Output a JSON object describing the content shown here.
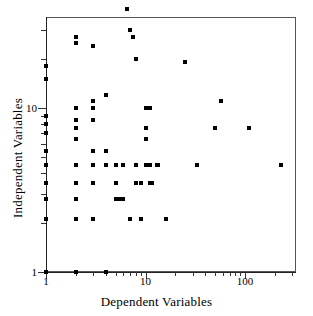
{
  "figure": {
    "background": "#ffffff",
    "frame_color": "#555555",
    "marker_color": "#000000"
  },
  "chart_data": {
    "type": "scatter",
    "title": "",
    "subtitle": "",
    "xlabel": "Dependent Variables",
    "ylabel": "Independent Variables",
    "xscale": "log",
    "yscale": "log",
    "xlim": [
      1,
      300
    ],
    "ylim": [
      1,
      45
    ],
    "grid": false,
    "legend": null,
    "xticks": [
      1,
      10,
      100
    ],
    "xticklabels": [
      "1",
      "10",
      "100"
    ],
    "yticks": [
      1,
      10
    ],
    "yticklabels": [
      "1",
      "10"
    ],
    "xminor": [
      2,
      3,
      4,
      5,
      6,
      7,
      8,
      9,
      20,
      30,
      40,
      50,
      60,
      70,
      80,
      90,
      200,
      300
    ],
    "yminor": [
      2,
      3,
      4,
      5,
      6,
      7,
      8,
      9,
      20,
      30,
      40
    ],
    "marker": "square",
    "marker_size_px": 4,
    "points": [
      [
        1,
        18
      ],
      [
        1,
        15
      ],
      [
        1,
        9
      ],
      [
        1,
        8
      ],
      [
        1,
        7
      ],
      [
        1,
        5.5
      ],
      [
        1,
        4.5
      ],
      [
        1,
        3.5
      ],
      [
        1,
        2.8
      ],
      [
        1,
        2.1
      ],
      [
        1,
        1.0
      ],
      [
        2,
        27
      ],
      [
        2,
        25
      ],
      [
        2,
        10
      ],
      [
        2,
        8.5
      ],
      [
        2,
        7.5
      ],
      [
        2,
        6.5
      ],
      [
        2,
        4.5
      ],
      [
        2,
        3.5
      ],
      [
        2,
        2.8
      ],
      [
        2,
        2.1
      ],
      [
        2,
        1.0
      ],
      [
        3,
        24
      ],
      [
        3,
        11
      ],
      [
        3,
        10
      ],
      [
        3,
        8.5
      ],
      [
        3,
        5.5
      ],
      [
        3,
        4.5
      ],
      [
        3,
        3.5
      ],
      [
        3,
        2.1
      ],
      [
        4,
        12
      ],
      [
        4,
        5.5
      ],
      [
        4,
        4.5
      ],
      [
        4,
        1.0
      ],
      [
        5,
        4.5
      ],
      [
        5,
        3.5
      ],
      [
        5,
        2.8
      ],
      [
        5.6,
        2.8
      ],
      [
        6,
        4.5
      ],
      [
        6,
        2.8
      ],
      [
        6.5,
        40
      ],
      [
        7,
        30
      ],
      [
        7,
        2.1
      ],
      [
        7.5,
        27
      ],
      [
        8,
        20
      ],
      [
        8,
        4.5
      ],
      [
        8,
        3.5
      ],
      [
        9,
        3.5
      ],
      [
        9,
        2.1
      ],
      [
        10,
        10
      ],
      [
        10,
        7.5
      ],
      [
        10,
        6.5
      ],
      [
        10,
        4.5
      ],
      [
        11,
        10
      ],
      [
        11,
        4.5
      ],
      [
        11,
        3.5
      ],
      [
        11.5,
        3.5
      ],
      [
        13,
        4.5
      ],
      [
        13.5,
        4.5
      ],
      [
        16,
        2.1
      ],
      [
        25,
        19
      ],
      [
        33,
        4.5
      ],
      [
        50,
        7.5
      ],
      [
        57,
        11
      ],
      [
        110,
        7.5
      ],
      [
        230,
        4.5
      ]
    ]
  }
}
